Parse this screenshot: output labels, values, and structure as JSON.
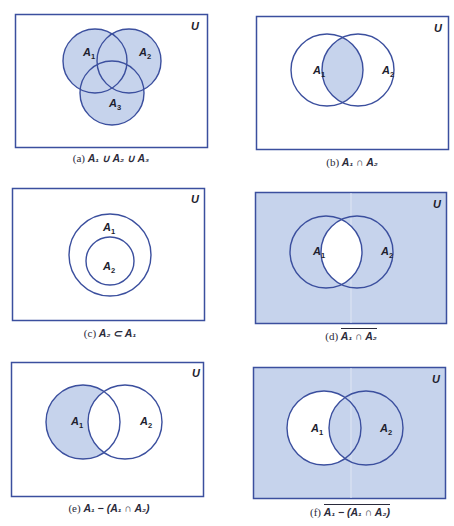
{
  "page_header": "",
  "colors": {
    "outline": "#3b4f9e",
    "fill": "#c6d3ec",
    "background": "#ffffff",
    "text": "#1e1e2e"
  },
  "universe_label": "U",
  "panels": [
    {
      "id": "a",
      "tag": "(a)",
      "expression": "A₁ ∪ A₂ ∪ A₃",
      "overline": false,
      "labels": {
        "A1": "A",
        "A1_sub": "1",
        "A2": "A",
        "A2_sub": "2",
        "A3": "A",
        "A3_sub": "3"
      },
      "shaded_region": "union of A1, A2, A3"
    },
    {
      "id": "b",
      "tag": "(b)",
      "expression": "A₁ ∩ A₂",
      "overline": false,
      "labels": {
        "A1": "A",
        "A1_sub": "1",
        "A2": "A",
        "A2_sub": "2"
      },
      "shaded_region": "intersection of A1 and A2"
    },
    {
      "id": "c",
      "tag": "(c)",
      "expression": "A₂ ⊂ A₁",
      "overline": false,
      "labels": {
        "A1": "A",
        "A1_sub": "1",
        "A2": "A",
        "A2_sub": "2"
      },
      "shaded_region": "none"
    },
    {
      "id": "d",
      "tag": "(d)",
      "expression": "A₁ ∩ A₂",
      "overline": true,
      "labels": {
        "A1": "A",
        "A1_sub": "1",
        "A2": "A",
        "A2_sub": "2"
      },
      "shaded_region": "complement of intersection"
    },
    {
      "id": "e",
      "tag": "(e)",
      "expression": "A₁ − (A₁ ∩ A₂)",
      "overline": false,
      "labels": {
        "A1": "A",
        "A1_sub": "1",
        "A2": "A",
        "A2_sub": "2"
      },
      "shaded_region": "A1 only"
    },
    {
      "id": "f",
      "tag": "(f)",
      "expression": "A₁ − (A₁ ∩ A₂)",
      "overline": true,
      "labels": {
        "A1": "A",
        "A1_sub": "1",
        "A2": "A",
        "A2_sub": "2"
      },
      "shaded_region": "complement of A1 only"
    }
  ]
}
